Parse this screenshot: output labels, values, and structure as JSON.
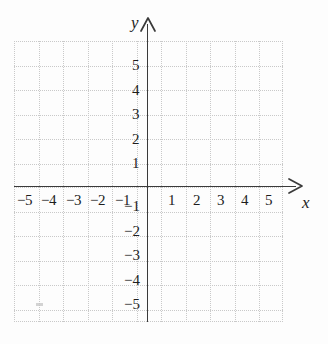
{
  "figure": {
    "kind": "cartesian-coordinate-plane",
    "background_color": "#fdfdfd",
    "axis_color": "#3a3a3a",
    "grid_color": "#c9c9c9",
    "label_color": "#1d1d1d"
  },
  "axes": {
    "x_name": "x",
    "y_name": "y",
    "x_arrow_icon": "arrow-right-icon",
    "y_arrow_icon": "arrow-up-icon"
  },
  "chart_data": {
    "type": "scatter",
    "title": "",
    "xlabel": "x",
    "ylabel": "y",
    "xlim": [
      -5.5,
      5.5
    ],
    "ylim": [
      -5.75,
      5.75
    ],
    "xticks": [
      -5,
      -4,
      -3,
      -2,
      -1,
      1,
      2,
      3,
      4,
      5
    ],
    "yticks": [
      -5,
      -4,
      -3,
      -2,
      -1,
      1,
      2,
      3,
      4,
      5
    ],
    "xticklabels": [
      "−5",
      "−4",
      "−3",
      "−2",
      "−1",
      "1",
      "2",
      "3",
      "4",
      "5"
    ],
    "yticklabels": [
      "−5",
      "−4",
      "−3",
      "−2",
      "−1",
      "1",
      "2",
      "3",
      "4",
      "5"
    ],
    "grid": true,
    "grid_style": "dotted",
    "grid_spacing": 1,
    "legend": false,
    "series": [
      {
        "name": "",
        "x": [],
        "y": []
      }
    ],
    "annotations": []
  },
  "tick_labels": {
    "x_negative": [
      {
        "value": "−5",
        "left": 17,
        "top": 193
      },
      {
        "value": "−4",
        "left": 41,
        "top": 193
      },
      {
        "value": "−3",
        "left": 66,
        "top": 193
      },
      {
        "value": "−2",
        "left": 90,
        "top": 193
      },
      {
        "value": "−1",
        "left": 115,
        "top": 193
      }
    ],
    "x_positive": [
      {
        "value": "1",
        "left": 168,
        "top": 193
      },
      {
        "value": "2",
        "left": 193,
        "top": 193
      },
      {
        "value": "3",
        "left": 217,
        "top": 193
      },
      {
        "value": "4",
        "left": 241,
        "top": 193
      },
      {
        "value": "5",
        "left": 265,
        "top": 193
      }
    ],
    "y_positive": [
      {
        "value": "5",
        "left": 132,
        "top": 58
      },
      {
        "value": "4",
        "left": 132,
        "top": 83
      },
      {
        "value": "3",
        "left": 132,
        "top": 107
      },
      {
        "value": "2",
        "left": 132,
        "top": 132
      },
      {
        "value": "1",
        "left": 132,
        "top": 156
      }
    ],
    "y_negative": [
      {
        "value": "−1",
        "left": 124,
        "top": 199
      },
      {
        "value": "−2",
        "left": 124,
        "top": 224
      },
      {
        "value": "−3",
        "left": 124,
        "top": 248
      },
      {
        "value": "−4",
        "left": 124,
        "top": 273
      },
      {
        "value": "−5",
        "left": 124,
        "top": 297
      }
    ]
  },
  "grid_lines": {
    "vertical_x": [
      0,
      24.5,
      49,
      73.5,
      98,
      122.5,
      147,
      171.5,
      196,
      220.5,
      245,
      268
    ],
    "horizontal_y": [
      0,
      24.5,
      49,
      73.5,
      98,
      122.5,
      146,
      170.5,
      195,
      219.5,
      244,
      268.5,
      280
    ]
  }
}
